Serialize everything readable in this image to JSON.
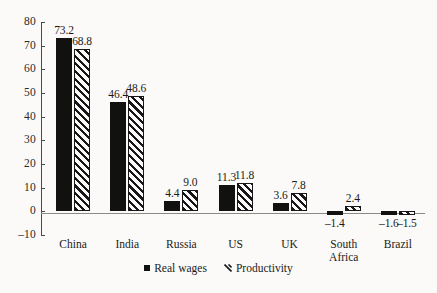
{
  "chart_data": {
    "type": "bar",
    "title": "",
    "subtitle": "",
    "xlabel": "",
    "ylabel": "",
    "ylim": [
      -10,
      80
    ],
    "yticks": [
      80,
      70,
      60,
      50,
      40,
      30,
      20,
      10,
      0,
      -10
    ],
    "ytick_labels": [
      "80",
      "70",
      "60",
      "50",
      "40",
      "30",
      "20",
      "10",
      "0",
      "–10"
    ],
    "grid": false,
    "legend_position": "bottom",
    "categories": [
      "China",
      "India",
      "Russia",
      "US",
      "UK",
      "South Africa",
      "Brazil"
    ],
    "category_lines": [
      [
        "China"
      ],
      [
        "India"
      ],
      [
        "Russia"
      ],
      [
        "US"
      ],
      [
        "UK"
      ],
      [
        "South",
        "Africa"
      ],
      [
        "Brazil"
      ]
    ],
    "series": [
      {
        "name": "Real wages",
        "style": "solid",
        "color": "#111110",
        "values": [
          73.2,
          46.4,
          4.4,
          11.3,
          3.6,
          -1.4,
          -1.6
        ],
        "labels": [
          "73.2",
          "46.4",
          "4.4",
          "11.3",
          "3.6",
          "–1.4",
          "–1.6"
        ]
      },
      {
        "name": "Productivity",
        "style": "hatched",
        "color": "#17171a",
        "values": [
          68.8,
          48.6,
          9.0,
          11.8,
          7.8,
          2.4,
          -1.5
        ],
        "labels": [
          "68.8",
          "48.6",
          "9.0",
          "11.8",
          "7.8",
          "2.4",
          "–1.5"
        ]
      }
    ]
  },
  "legend": {
    "items": [
      {
        "label": "Real wages",
        "marker": "solid-square-marker"
      },
      {
        "label": "Productivity",
        "marker": "hatched-square-marker"
      }
    ]
  },
  "colors": {
    "background": "#fbfaf8",
    "series_solid": "#111110",
    "series_hatch": "#17171a",
    "axis": "#4a4a48",
    "zero_line": "#8a8a86",
    "text": "#1a1a18"
  }
}
